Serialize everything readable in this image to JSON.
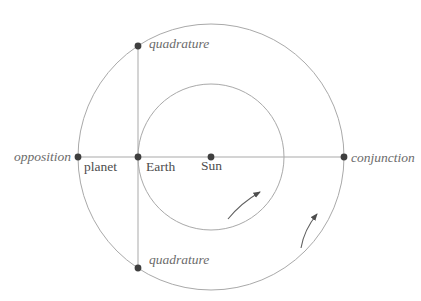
{
  "diagram": {
    "labels": {
      "opposition": "opposition",
      "conjunction": "conjunction",
      "quadrature_top": "quadrature",
      "quadrature_bottom": "quadrature",
      "planet": "planet",
      "earth": "Earth",
      "sun": "Sun"
    },
    "colors": {
      "background": "#ffffff",
      "orbit_stroke": "#a9a9a9",
      "connector_stroke": "#a9a9a9",
      "dot_fill": "#3f3f3f",
      "config_label_color": "#6b6b6b",
      "body_label_color": "#4d4d4d",
      "arrow_stroke": "#5f5f5f",
      "arrowhead_fill": "#4d4d4d"
    },
    "icons": {
      "inner_arrow": "orbit-direction-arrow (counterclockwise, inner orbit)",
      "outer_arrow": "orbit-direction-arrow (counterclockwise, outer orbit)"
    }
  }
}
